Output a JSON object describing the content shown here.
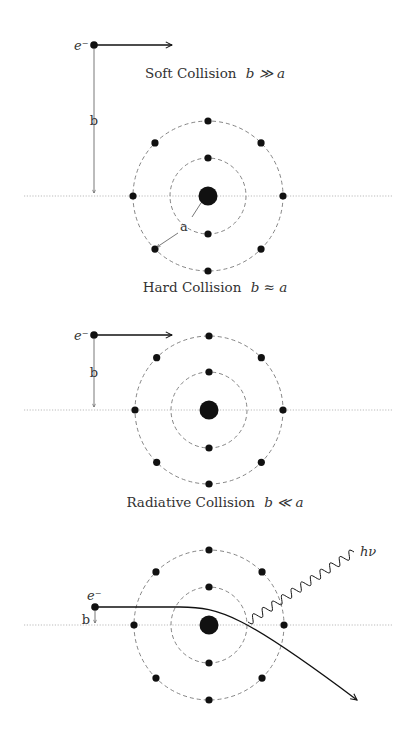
{
  "diagram": {
    "width": 410,
    "height": 729,
    "colors": {
      "ink": "#111111",
      "text": "#333333",
      "orbit": "#777777",
      "axis": "#bbbbbb",
      "arrow": "#555555"
    },
    "panels": [
      {
        "id": "soft",
        "title": "Soft Collision",
        "relation": "b ≫ a",
        "title_pos": [
          215,
          78
        ],
        "nucleus": [
          208,
          196
        ],
        "inner_radius": 38,
        "outer_radius": 75,
        "axis_y": 196,
        "axis_x": [
          24,
          392
        ],
        "electron": {
          "label": "e⁻",
          "pos": [
            94,
            45
          ],
          "arrow_to": [
            172,
            45
          ]
        },
        "impact_parameter": {
          "label": "b",
          "x": 94,
          "y_from": 48,
          "y_to": 193
        },
        "radius_label": {
          "label": "a",
          "pos": [
            184,
            227
          ]
        },
        "trajectory": "straight"
      },
      {
        "id": "hard",
        "title": "Hard Collision",
        "relation": "b ≈ a",
        "title_pos": [
          215,
          292
        ],
        "nucleus": [
          209,
          410
        ],
        "inner_radius": 38,
        "outer_radius": 74,
        "axis_y": 410,
        "axis_x": [
          24,
          392
        ],
        "electron": {
          "label": "e⁻",
          "pos": [
            94,
            335
          ],
          "arrow_to": [
            172,
            335
          ]
        },
        "impact_parameter": {
          "label": "b",
          "x": 94,
          "y_from": 338,
          "y_to": 407
        },
        "trajectory": "straight"
      },
      {
        "id": "radiative",
        "title": "Radiative Collision",
        "relation": "b ≪ a",
        "title_pos": [
          215,
          507
        ],
        "nucleus": [
          209,
          625
        ],
        "inner_radius": 38,
        "outer_radius": 75,
        "axis_y": 625,
        "axis_x": [
          24,
          392
        ],
        "electron": {
          "label": "e⁻",
          "pos": [
            95,
            607
          ]
        },
        "impact_parameter": {
          "label": "b",
          "x": 95,
          "y_from": 610,
          "y_to": 623
        },
        "trajectory": "deflected",
        "deflected_path": {
          "start": [
            95,
            607
          ],
          "end": [
            357,
            700
          ]
        },
        "photon": {
          "label": "hν",
          "from": [
            248,
            622
          ],
          "to": [
            354,
            552
          ]
        }
      }
    ]
  }
}
